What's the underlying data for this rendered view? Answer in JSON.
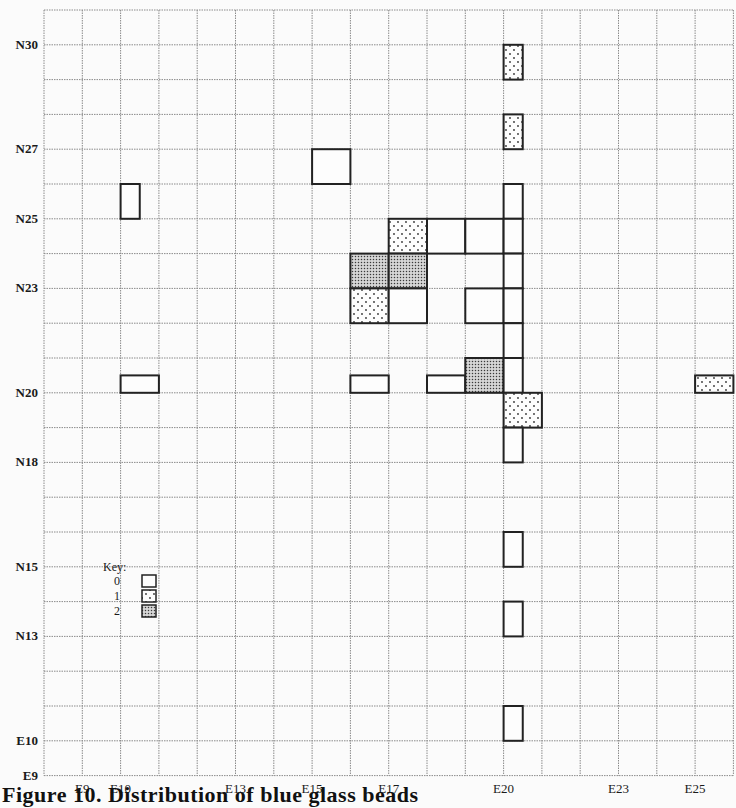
{
  "figure": {
    "caption": "Figure 10. Distribution of blue glass beads",
    "grid": {
      "origin_px": {
        "x": 44,
        "y": 10
      },
      "cell_px": {
        "w": 38.3,
        "h": 34.8
      },
      "col_start": 8,
      "col_end": 26,
      "row_top": 31,
      "row_bottom": 9,
      "gridline_color": "#8a8a8a",
      "marker_color": "#222222"
    },
    "x_axis_labels": [
      {
        "label": "E9",
        "col": 9
      },
      {
        "label": "E10",
        "col": 10
      },
      {
        "label": "E13",
        "col": 13
      },
      {
        "label": "E15",
        "col": 15
      },
      {
        "label": "E17",
        "col": 17
      },
      {
        "label": "E20",
        "col": 20
      },
      {
        "label": "E23",
        "col": 23
      },
      {
        "label": "E25",
        "col": 25
      }
    ],
    "y_axis_labels": [
      {
        "label": "N30",
        "row": 30
      },
      {
        "label": "N27",
        "row": 27
      },
      {
        "label": "N25",
        "row": 25
      },
      {
        "label": "N23",
        "row": 23
      },
      {
        "label": "N20",
        "row": 20
      },
      {
        "label": "N18",
        "row": 18
      },
      {
        "label": "N15",
        "row": 15
      },
      {
        "label": "N13",
        "row": 13
      },
      {
        "label": "E10",
        "row": 10
      },
      {
        "label": "E9",
        "row": 9
      }
    ],
    "key": {
      "title": "Key:",
      "entries": [
        {
          "label": "0",
          "pattern": "empty"
        },
        {
          "label": "1",
          "pattern": "dotted"
        },
        {
          "label": "2",
          "pattern": "stippled"
        }
      ]
    },
    "markers": [
      {
        "e": 20,
        "n": 29,
        "w": 0.5,
        "h": 1,
        "value": 1
      },
      {
        "e": 20,
        "n": 27,
        "w": 0.5,
        "h": 1,
        "value": 1
      },
      {
        "e": 15,
        "n": 26,
        "w": 1,
        "h": 1,
        "value": 0
      },
      {
        "e": 10,
        "n": 25,
        "w": 0.5,
        "h": 1,
        "value": 0
      },
      {
        "e": 20,
        "n": 25,
        "w": 0.5,
        "h": 1,
        "value": 0
      },
      {
        "e": 17,
        "n": 24,
        "w": 1,
        "h": 1,
        "value": 1
      },
      {
        "e": 18,
        "n": 24,
        "w": 1,
        "h": 1,
        "value": 0
      },
      {
        "e": 19,
        "n": 24,
        "w": 1,
        "h": 1,
        "value": 0
      },
      {
        "e": 20,
        "n": 24,
        "w": 0.5,
        "h": 1,
        "value": 0
      },
      {
        "e": 16,
        "n": 23,
        "w": 1,
        "h": 1,
        "value": 2
      },
      {
        "e": 17,
        "n": 23,
        "w": 1,
        "h": 1,
        "value": 2
      },
      {
        "e": 20,
        "n": 23,
        "w": 0.5,
        "h": 1,
        "value": 0
      },
      {
        "e": 16,
        "n": 22,
        "w": 1,
        "h": 1,
        "value": 1
      },
      {
        "e": 17,
        "n": 22,
        "w": 1,
        "h": 1,
        "value": 0
      },
      {
        "e": 19,
        "n": 22,
        "w": 1,
        "h": 1,
        "value": 0
      },
      {
        "e": 20,
        "n": 22,
        "w": 0.5,
        "h": 1,
        "value": 0
      },
      {
        "e": 20,
        "n": 21,
        "w": 0.5,
        "h": 1,
        "value": 0
      },
      {
        "e": 10,
        "n": 20,
        "w": 1,
        "h": 0.5,
        "value": 0
      },
      {
        "e": 16,
        "n": 20,
        "w": 1,
        "h": 0.5,
        "value": 0
      },
      {
        "e": 18,
        "n": 20,
        "w": 1,
        "h": 0.5,
        "value": 0
      },
      {
        "e": 19,
        "n": 20,
        "w": 1,
        "h": 1,
        "value": 2
      },
      {
        "e": 20,
        "n": 20,
        "w": 0.5,
        "h": 1,
        "value": 0
      },
      {
        "e": 25,
        "n": 20,
        "w": 1,
        "h": 0.5,
        "value": 1
      },
      {
        "e": 20,
        "n": 19,
        "w": 1,
        "h": 1,
        "value": 1
      },
      {
        "e": 20,
        "n": 18,
        "w": 0.5,
        "h": 1,
        "value": 0
      },
      {
        "e": 20,
        "n": 15,
        "w": 0.5,
        "h": 1,
        "value": 0
      },
      {
        "e": 20,
        "n": 13,
        "w": 0.5,
        "h": 1,
        "value": 0
      },
      {
        "e": 20,
        "n": 10,
        "w": 0.5,
        "h": 1,
        "value": 0
      }
    ]
  }
}
